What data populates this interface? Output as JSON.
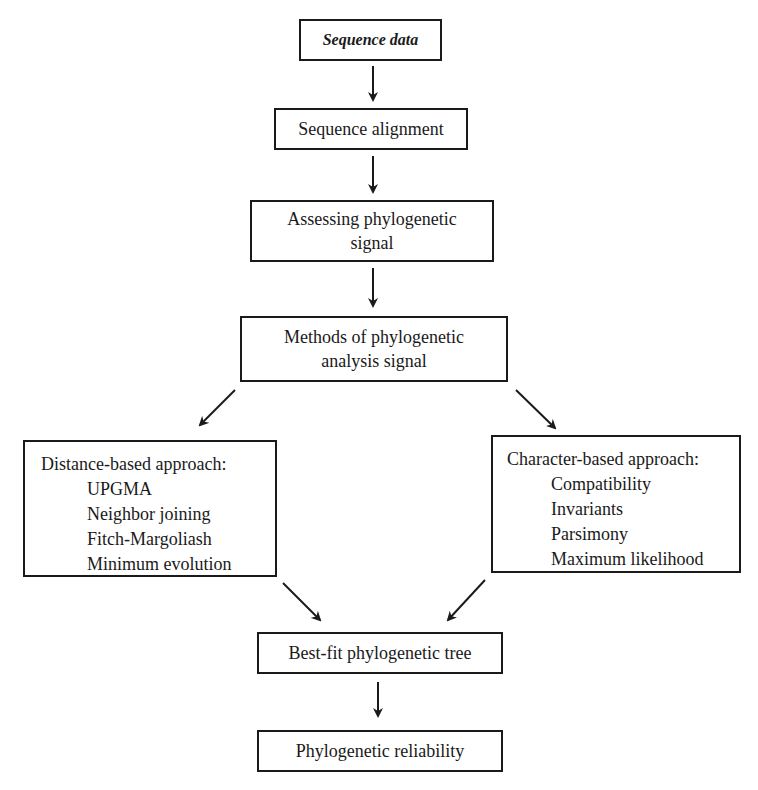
{
  "diagram": {
    "nodes": {
      "sequence_data": "Sequence data",
      "sequence_alignment": "Sequence alignment",
      "assessing_signal": [
        "Assessing phylogenetic",
        "signal"
      ],
      "methods": [
        "Methods of phylogenetic",
        "analysis signal"
      ],
      "distance_based": {
        "title": "Distance-based approach:",
        "items": [
          "UPGMA",
          "Neighbor joining",
          "Fitch-Margoliash",
          "Minimum evolution"
        ]
      },
      "character_based": {
        "title": "Character-based approach:",
        "items": [
          "Compatibility",
          "Invariants",
          "Parsimony",
          "Maximum likelihood"
        ]
      },
      "best_fit_tree": "Best-fit phylogenetic tree",
      "reliability": "Phylogenetic reliability"
    },
    "edges": [
      [
        "sequence_data",
        "sequence_alignment"
      ],
      [
        "sequence_alignment",
        "assessing_signal"
      ],
      [
        "assessing_signal",
        "methods"
      ],
      [
        "methods",
        "distance_based"
      ],
      [
        "methods",
        "character_based"
      ],
      [
        "distance_based",
        "best_fit_tree"
      ],
      [
        "character_based",
        "best_fit_tree"
      ],
      [
        "best_fit_tree",
        "reliability"
      ]
    ]
  }
}
